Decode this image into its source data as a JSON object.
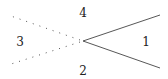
{
  "diagram": {
    "type": "region-partition",
    "vertex": {
      "x": 83,
      "y": 41
    },
    "solid_rays": [
      {
        "to": {
          "x": 160,
          "y": 15
        }
      },
      {
        "to": {
          "x": 160,
          "y": 68
        }
      }
    ],
    "dotted_rays": [
      {
        "to": {
          "x": 8,
          "y": 15
        }
      },
      {
        "to": {
          "x": 8,
          "y": 65
        }
      }
    ],
    "labels": [
      {
        "text": "1",
        "x": 146,
        "y": 46
      },
      {
        "text": "2",
        "x": 83,
        "y": 75
      },
      {
        "text": "3",
        "x": 20,
        "y": 46
      },
      {
        "text": "4",
        "x": 83,
        "y": 17
      }
    ],
    "colors": {
      "line": "#444444",
      "dots": "#555555",
      "text": "#222222"
    }
  }
}
